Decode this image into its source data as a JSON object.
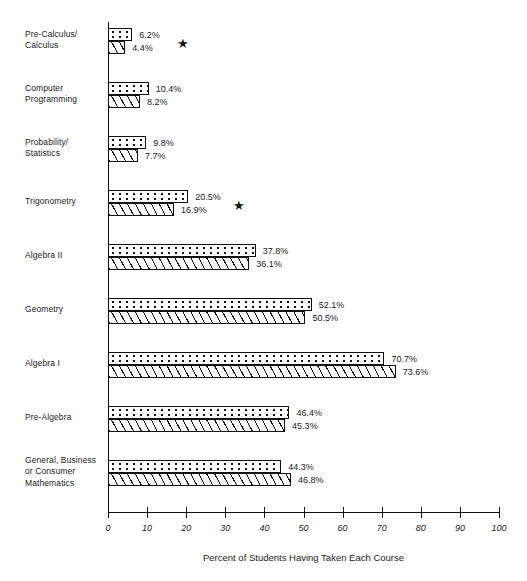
{
  "chart_data": {
    "type": "bar",
    "orientation": "horizontal",
    "title": "",
    "xlabel": "Percent of Students Having Taken Each Course",
    "ylabel": "",
    "xlim": [
      0,
      100
    ],
    "xticks": [
      0,
      10,
      20,
      30,
      40,
      50,
      60,
      70,
      80,
      90,
      100
    ],
    "xtick_labels": [
      "0",
      "10",
      "20",
      "30",
      "40",
      "50",
      "60",
      "70",
      "80",
      "90",
      "100"
    ],
    "grid": false,
    "legend": "none",
    "categories": [
      "Pre-Calculus/\nCalculus",
      "Computer\nProgramming",
      "Probability/\nStatistics",
      "Trigonometry",
      "Algebra II",
      "Geometry",
      "Algebra I",
      "Pre-Algebra",
      "General, Business\nor Consumer\nMathematics"
    ],
    "series": [
      {
        "name": "dotted",
        "pattern": "dotted",
        "values": [
          6.2,
          10.4,
          9.8,
          20.5,
          37.8,
          52.1,
          70.7,
          46.4,
          44.3
        ],
        "value_labels": [
          "6.2%",
          "10.4%",
          "9.8%",
          "20.5%",
          "37.8%",
          "52.1%",
          "70.7%",
          "46.4%",
          "44.3%"
        ]
      },
      {
        "name": "hatched",
        "pattern": "diagonal-hatch",
        "values": [
          4.4,
          8.2,
          7.7,
          16.9,
          36.1,
          50.5,
          73.6,
          45.3,
          46.8
        ],
        "value_labels": [
          "4.4%",
          "8.2%",
          "7.7%",
          "16.9%",
          "36.1%",
          "50.5%",
          "73.6%",
          "45.3%",
          "46.8%"
        ]
      }
    ],
    "annotations": [
      {
        "symbol": "★",
        "category": "Pre-Calculus/\nCalculus"
      },
      {
        "symbol": "★",
        "category": "Trigonometry"
      }
    ]
  },
  "axis": {
    "x_title": "Percent of Students Having Taken Each Course"
  },
  "groups": [
    {
      "label_lines": [
        "Pre-Calculus/",
        "Calculus"
      ],
      "top_value": "6.2%",
      "bottom_value": "4.4%",
      "starred": true
    },
    {
      "label_lines": [
        "Computer",
        "Programming"
      ],
      "top_value": "10.4%",
      "bottom_value": "8.2%",
      "starred": false
    },
    {
      "label_lines": [
        "Probability/",
        "Statistics"
      ],
      "top_value": "9.8%",
      "bottom_value": "7.7%",
      "starred": false
    },
    {
      "label_lines": [
        "Trigonometry"
      ],
      "top_value": "20.5%",
      "bottom_value": "16.9%",
      "starred": true
    },
    {
      "label_lines": [
        "Algebra II"
      ],
      "top_value": "37.8%",
      "bottom_value": "36.1%",
      "starred": false
    },
    {
      "label_lines": [
        "Geometry"
      ],
      "top_value": "52.1%",
      "bottom_value": "50.5%",
      "starred": false
    },
    {
      "label_lines": [
        "Algebra I"
      ],
      "top_value": "70.7%",
      "bottom_value": "73.6%",
      "starred": false
    },
    {
      "label_lines": [
        "Pre-Algebra"
      ],
      "top_value": "46.4%",
      "bottom_value": "45.3%",
      "starred": false
    },
    {
      "label_lines": [
        "General, Business",
        "or Consumer",
        "Mathematics"
      ],
      "top_value": "44.3%",
      "bottom_value": "46.8%",
      "starred": false
    }
  ],
  "star_symbol": "★",
  "colors": {
    "ink": "#111111",
    "background": "#ffffff"
  },
  "geometry": {
    "axis_x0": 108,
    "axis_x100": 499,
    "axis_top": 22,
    "axis_bottom": 512,
    "group_first_top": 28,
    "group_step": 54,
    "bar_height": 13
  }
}
